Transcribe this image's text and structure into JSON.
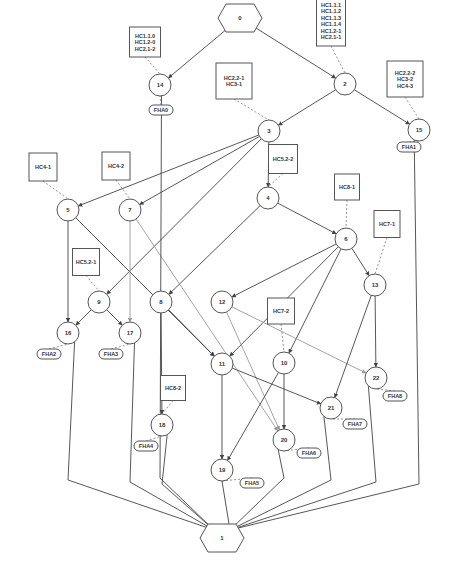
{
  "diagram": {
    "terminals": [
      {
        "id": "0",
        "label": "0",
        "x": 240,
        "y": 18,
        "role": "start"
      },
      {
        "id": "1",
        "label": "1",
        "x": 222,
        "y": 538,
        "role": "end"
      }
    ],
    "nodes": [
      {
        "id": "14",
        "label": "14",
        "x": 160,
        "y": 85
      },
      {
        "id": "2",
        "label": "2",
        "x": 345,
        "y": 84
      },
      {
        "id": "3",
        "label": "3",
        "x": 269,
        "y": 131
      },
      {
        "id": "15",
        "label": "15",
        "x": 419,
        "y": 130
      },
      {
        "id": "5",
        "label": "5",
        "x": 68,
        "y": 210
      },
      {
        "id": "7",
        "label": "7",
        "x": 130,
        "y": 210
      },
      {
        "id": "4",
        "label": "4",
        "x": 268,
        "y": 198
      },
      {
        "id": "6",
        "label": "6",
        "x": 346,
        "y": 239
      },
      {
        "id": "13",
        "label": "13",
        "x": 375,
        "y": 285
      },
      {
        "id": "9",
        "label": "9",
        "x": 99,
        "y": 302
      },
      {
        "id": "8",
        "label": "8",
        "x": 161,
        "y": 302
      },
      {
        "id": "12",
        "label": "12",
        "x": 222,
        "y": 302
      },
      {
        "id": "16",
        "label": "16",
        "x": 68,
        "y": 333
      },
      {
        "id": "17",
        "label": "17",
        "x": 130,
        "y": 333
      },
      {
        "id": "11",
        "label": "11",
        "x": 222,
        "y": 364
      },
      {
        "id": "10",
        "label": "10",
        "x": 284,
        "y": 363
      },
      {
        "id": "22",
        "label": "22",
        "x": 376,
        "y": 378
      },
      {
        "id": "21",
        "label": "21",
        "x": 331,
        "y": 408
      },
      {
        "id": "18",
        "label": "18",
        "x": 162,
        "y": 425
      },
      {
        "id": "20",
        "label": "20",
        "x": 284,
        "y": 440
      },
      {
        "id": "19",
        "label": "19",
        "x": 222,
        "y": 470
      }
    ],
    "hc_boxes": [
      {
        "id": "hc-14",
        "attached_to": "14",
        "lines": [
          "HC1.1.0",
          "HC1.2-0",
          "HC2.1-2"
        ],
        "x": 145,
        "y": 42,
        "w": 31,
        "h": 30
      },
      {
        "id": "hc-2",
        "attached_to": "2",
        "lines": [
          "HC1.1.1",
          "HC1.1.2",
          "HC1.1.3",
          "HC1.1.4",
          "HC1.2-1",
          "HC2.1-1"
        ],
        "x": 331,
        "y": 21,
        "w": 29,
        "h": 50
      },
      {
        "id": "hc-3",
        "attached_to": "3",
        "lines": [
          "HC2.2-1",
          "HC3-1"
        ],
        "x": 234,
        "y": 81,
        "w": 36,
        "h": 36
      },
      {
        "id": "hc-15",
        "attached_to": "15",
        "lines": [
          "HC2.2-2",
          "HC3-2",
          "HC4-3"
        ],
        "x": 405,
        "y": 79,
        "w": 36,
        "h": 36
      },
      {
        "id": "hc-5",
        "attached_to": "5",
        "lines": [
          "HC4-1"
        ],
        "x": 43,
        "y": 167,
        "w": 28,
        "h": 28
      },
      {
        "id": "hc-7",
        "attached_to": "7",
        "lines": [
          "HC4-2"
        ],
        "x": 116,
        "y": 166,
        "w": 28,
        "h": 28
      },
      {
        "id": "hc-4",
        "attached_to": "4",
        "lines": [
          "HC5.2-2"
        ],
        "x": 283,
        "y": 159,
        "w": 29,
        "h": 29
      },
      {
        "id": "hc-6",
        "attached_to": "6",
        "lines": [
          "HC8-1"
        ],
        "x": 347,
        "y": 187,
        "w": 25,
        "h": 26
      },
      {
        "id": "hc-13",
        "attached_to": "13",
        "lines": [
          "HC7-1"
        ],
        "x": 387,
        "y": 224,
        "w": 26,
        "h": 27
      },
      {
        "id": "hc-9",
        "attached_to": "9",
        "lines": [
          "HC5.2-1"
        ],
        "x": 86,
        "y": 262,
        "w": 27,
        "h": 27
      },
      {
        "id": "hc-10",
        "attached_to": "10",
        "lines": [
          "HC7-2"
        ],
        "x": 281,
        "y": 311,
        "w": 27,
        "h": 26
      },
      {
        "id": "hc-18",
        "attached_to": "18",
        "lines": [
          "HC8-2"
        ],
        "x": 173,
        "y": 388,
        "w": 25,
        "h": 25
      }
    ],
    "fha_labels": [
      {
        "id": "fha-0",
        "attached_to": "14",
        "label": "FHA0",
        "x": 161,
        "y": 110
      },
      {
        "id": "fha-1",
        "attached_to": "15",
        "label": "FHA1",
        "x": 409,
        "y": 147
      },
      {
        "id": "fha-2",
        "attached_to": "16",
        "label": "FHA2",
        "x": 49,
        "y": 354
      },
      {
        "id": "fha-3",
        "attached_to": "17",
        "label": "FHA3",
        "x": 111,
        "y": 354
      },
      {
        "id": "fha-4",
        "attached_to": "18",
        "label": "FHA4",
        "x": 146,
        "y": 446
      },
      {
        "id": "fha-5",
        "attached_to": "19",
        "label": "FHA5",
        "x": 252,
        "y": 483
      },
      {
        "id": "fha-6",
        "attached_to": "20",
        "label": "FHA6",
        "x": 309,
        "y": 453
      },
      {
        "id": "fha-7",
        "attached_to": "21",
        "label": "FHA7",
        "x": 355,
        "y": 424
      },
      {
        "id": "fha-8",
        "attached_to": "22",
        "label": "FHA8",
        "x": 395,
        "y": 396
      }
    ],
    "edges": [
      {
        "from": "0",
        "to": "14"
      },
      {
        "from": "0",
        "to": "2"
      },
      {
        "from": "2",
        "to": "3"
      },
      {
        "from": "2",
        "to": "15"
      },
      {
        "from": "3",
        "to": "5"
      },
      {
        "from": "3",
        "to": "7"
      },
      {
        "from": "3",
        "to": "4"
      },
      {
        "from": "3",
        "to": "9"
      },
      {
        "from": "4",
        "to": "6"
      },
      {
        "from": "4",
        "to": "8"
      },
      {
        "from": "5",
        "to": "16"
      },
      {
        "from": "5",
        "to": "11"
      },
      {
        "from": "7",
        "to": "17",
        "style": "light"
      },
      {
        "from": "7",
        "to": "20",
        "style": "light"
      },
      {
        "from": "9",
        "to": "16"
      },
      {
        "from": "9",
        "to": "17"
      },
      {
        "from": "6",
        "to": "12"
      },
      {
        "from": "6",
        "to": "11"
      },
      {
        "from": "6",
        "to": "10"
      },
      {
        "from": "6",
        "to": "13"
      },
      {
        "from": "8",
        "to": "11"
      },
      {
        "from": "8",
        "to": "18"
      },
      {
        "from": "12",
        "to": "22",
        "style": "light"
      },
      {
        "from": "12",
        "to": "20",
        "style": "light"
      },
      {
        "from": "13",
        "to": "22"
      },
      {
        "from": "13",
        "to": "21"
      },
      {
        "from": "11",
        "to": "19"
      },
      {
        "from": "11",
        "to": "21"
      },
      {
        "from": "10",
        "to": "20"
      },
      {
        "from": "10",
        "to": "19"
      },
      {
        "from": "14",
        "to": "1"
      },
      {
        "from": "16",
        "to": "1"
      },
      {
        "from": "17",
        "to": "1"
      },
      {
        "from": "18",
        "to": "1"
      },
      {
        "from": "19",
        "to": "1"
      },
      {
        "from": "20",
        "to": "1"
      },
      {
        "from": "21",
        "to": "1"
      },
      {
        "from": "22",
        "to": "1"
      },
      {
        "from": "15",
        "to": "1"
      }
    ]
  }
}
